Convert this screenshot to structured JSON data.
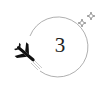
{
  "badge": {
    "number": "3",
    "colors": {
      "line": "#9a9a9a",
      "plane": "#111111",
      "text": "#222222"
    },
    "icons": [
      "airplane-icon",
      "sparkle-icon"
    ]
  }
}
